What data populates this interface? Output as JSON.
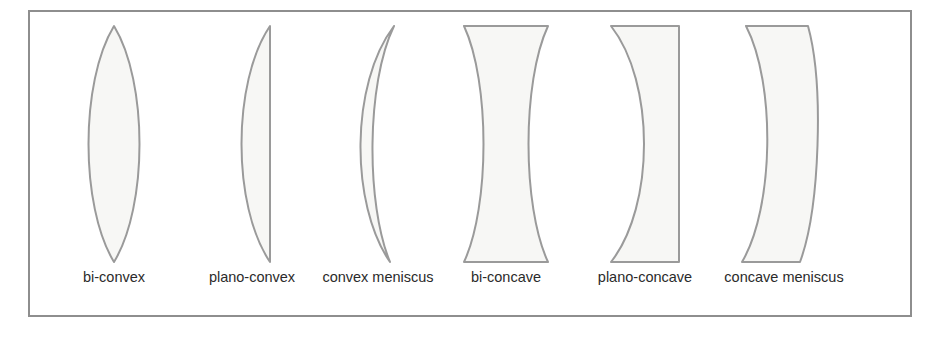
{
  "figure": {
    "background_color": "#ffffff",
    "frame_color": "#8e8e8e",
    "lens_stroke_color": "#9a9a9a",
    "lens_fill_color": "#f7f7f5",
    "caption_color": "#2b2b2b"
  },
  "lenses": [
    {
      "id": "bi-convex",
      "label": "bi-convex",
      "shape": "both surfaces convex, lens/vesica outline pointed at top and bottom",
      "left_surface": "convex",
      "right_surface": "convex"
    },
    {
      "id": "plano-convex",
      "label": "plano-convex",
      "shape": "flat right face, convex bulging left face",
      "left_surface": "convex",
      "right_surface": "flat"
    },
    {
      "id": "convex-meniscus",
      "label": "convex meniscus",
      "shape": "crescent, both surfaces curve the same direction, thicker in the middle",
      "left_surface": "convex",
      "right_surface": "concave"
    },
    {
      "id": "bi-concave",
      "label": "bi-concave",
      "shape": "hourglass, both surfaces concave, wide at top and bottom, narrow waist",
      "left_surface": "concave",
      "right_surface": "concave"
    },
    {
      "id": "plano-concave",
      "label": "plano-concave",
      "shape": "flat right face, concave left face bowing inward to the right",
      "left_surface": "concave",
      "right_surface": "flat"
    },
    {
      "id": "concave-meniscus",
      "label": "concave meniscus",
      "shape": "curved band, both surfaces curve right, thinner in the middle",
      "left_surface": "concave",
      "right_surface": "convex"
    }
  ]
}
